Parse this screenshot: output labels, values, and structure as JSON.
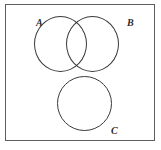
{
  "figure": {
    "type": "venn-diagram",
    "width": 161,
    "height": 150,
    "background_color": "#ffffff",
    "frame": {
      "stroke_color": "#5d5d5d",
      "fill_color": "#ffffff",
      "stroke_width": 1
    },
    "sets": [
      {
        "id": "A",
        "label": "A",
        "label_position": "top-left-outside",
        "shape": "circle",
        "stroke_color": "#3a3a3a",
        "fill": "none",
        "center_x": 60,
        "center_y": 44,
        "radius": 27
      },
      {
        "id": "B",
        "label": "B",
        "label_position": "top-right-outside",
        "shape": "circle",
        "stroke_color": "#3a3a3a",
        "fill": "none",
        "center_x": 92,
        "center_y": 44,
        "radius": 27
      },
      {
        "id": "C",
        "label": "C",
        "label_position": "bottom-right-outside",
        "shape": "circle",
        "stroke_color": "#3a3a3a",
        "fill": "none",
        "center_x": 84,
        "center_y": 103,
        "radius": 27
      }
    ],
    "relations": {
      "A_B": "overlapping",
      "A_C": "disjoint",
      "B_C": "disjoint"
    }
  }
}
